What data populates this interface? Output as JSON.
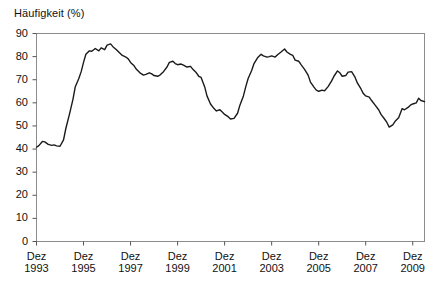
{
  "chart_data": {
    "type": "line",
    "title": "Häufigkeit (%)",
    "xlabel": "",
    "ylabel": "Häufigkeit (%)",
    "ylim": [
      0,
      90
    ],
    "ytick_values": [
      0,
      10,
      20,
      30,
      40,
      50,
      60,
      70,
      80,
      90
    ],
    "ytick_labels": [
      "0",
      "10",
      "20",
      "30",
      "40",
      "50",
      "60",
      "70",
      "80",
      "90"
    ],
    "xtick_labels": [
      {
        "line1": "Dez",
        "line2": "1993"
      },
      {
        "line1": "Dez",
        "line2": "1995"
      },
      {
        "line1": "Dez",
        "line2": "1997"
      },
      {
        "line1": "Dez",
        "line2": "1999"
      },
      {
        "line1": "Dez",
        "line2": "2001"
      },
      {
        "line1": "Dez",
        "line2": "2003"
      },
      {
        "line1": "Dez",
        "line2": "2005"
      },
      {
        "line1": "Dez",
        "line2": "2007"
      },
      {
        "line1": "Dez",
        "line2": "2009"
      }
    ],
    "xtick_x_values": [
      1993.95,
      1995.95,
      1997.95,
      1999.95,
      2001.95,
      2003.95,
      2005.95,
      2007.95,
      2009.95
    ],
    "xlim": [
      1993.95,
      2010.45
    ],
    "grid": false,
    "legend": null,
    "series": [
      {
        "name": "Häufigkeit",
        "color": "#1a1a1a",
        "x": [
          1993.95,
          1994.05,
          1994.2,
          1994.3,
          1994.45,
          1994.6,
          1994.7,
          1994.8,
          1994.95,
          1995.1,
          1995.2,
          1995.35,
          1995.5,
          1995.6,
          1995.75,
          1995.85,
          1995.95,
          1996.05,
          1996.2,
          1996.3,
          1996.45,
          1996.6,
          1996.7,
          1996.85,
          1996.95,
          1997.1,
          1997.2,
          1997.35,
          1997.5,
          1997.6,
          1997.75,
          1997.85,
          1997.95,
          1998.1,
          1998.2,
          1998.35,
          1998.5,
          1998.6,
          1998.75,
          1998.85,
          1998.95,
          1999.1,
          1999.2,
          1999.35,
          1999.5,
          1999.6,
          1999.75,
          1999.85,
          1999.95,
          2000.1,
          2000.2,
          2000.35,
          2000.5,
          2000.6,
          2000.75,
          2000.85,
          2000.95,
          2001.1,
          2001.2,
          2001.35,
          2001.5,
          2001.6,
          2001.75,
          2001.85,
          2001.95,
          2002.1,
          2002.2,
          2002.35,
          2002.5,
          2002.6,
          2002.75,
          2002.85,
          2002.95,
          2003.1,
          2003.2,
          2003.35,
          2003.5,
          2003.6,
          2003.75,
          2003.85,
          2003.95,
          2004.1,
          2004.2,
          2004.35,
          2004.5,
          2004.6,
          2004.75,
          2004.85,
          2004.95,
          2005.1,
          2005.2,
          2005.35,
          2005.5,
          2005.6,
          2005.75,
          2005.85,
          2005.95,
          2006.1,
          2006.2,
          2006.35,
          2006.5,
          2006.6,
          2006.75,
          2006.85,
          2006.95,
          2007.1,
          2007.2,
          2007.35,
          2007.5,
          2007.6,
          2007.75,
          2007.85,
          2007.95,
          2008.1,
          2008.2,
          2008.35,
          2008.5,
          2008.6,
          2008.75,
          2008.85,
          2008.95,
          2009.1,
          2009.2,
          2009.35,
          2009.5,
          2009.6,
          2009.75,
          2009.85,
          2009.95,
          2010.1,
          2010.2,
          2010.3,
          2010.45
        ],
        "y": [
          40.8,
          41.5,
          43.3,
          43.1,
          42.0,
          41.6,
          41.8,
          41.4,
          41.2,
          44.0,
          49.0,
          55.0,
          61.5,
          67.0,
          70.5,
          73.5,
          77.5,
          81.0,
          82.5,
          82.3,
          83.5,
          82.5,
          83.8,
          83.0,
          85.0,
          85.5,
          84.3,
          83.0,
          81.5,
          80.5,
          79.8,
          79.0,
          77.5,
          76.0,
          74.5,
          73.0,
          72.0,
          72.3,
          73.0,
          72.5,
          71.8,
          71.5,
          72.0,
          73.5,
          75.5,
          77.5,
          78.0,
          77.0,
          76.5,
          76.8,
          76.3,
          75.5,
          75.8,
          74.5,
          73.0,
          71.5,
          71.0,
          67.0,
          63.0,
          59.5,
          57.5,
          56.5,
          57.0,
          56.0,
          55.0,
          54.0,
          53.0,
          53.3,
          55.5,
          59.0,
          63.0,
          67.0,
          70.5,
          74.0,
          77.0,
          79.5,
          81.0,
          80.3,
          79.8,
          80.0,
          80.3,
          79.8,
          80.8,
          82.0,
          83.3,
          82.0,
          81.0,
          80.5,
          78.5,
          78.0,
          76.5,
          74.5,
          72.0,
          69.0,
          66.8,
          65.5,
          65.0,
          65.5,
          65.2,
          67.0,
          69.5,
          71.5,
          73.8,
          73.0,
          71.5,
          71.8,
          73.3,
          73.5,
          71.0,
          68.5,
          66.0,
          64.0,
          63.0,
          62.5,
          61.0,
          59.0,
          57.0,
          55.0,
          53.0,
          51.5,
          49.5,
          50.5,
          52.0,
          53.5,
          57.5,
          57.0,
          58.0,
          59.0,
          59.5,
          60.0,
          62.0,
          61.0,
          60.5
        ]
      }
    ],
    "series_extra": {
      "note": "continuation",
      "x": [
        2010.45,
        2010.6,
        2010.75,
        2010.85
      ],
      "y": [
        60.5,
        61.0,
        62.0,
        61.5
      ]
    }
  },
  "axes": {
    "frame_color": "#888888",
    "tick_color": "#555555",
    "line_color": "#1a1a1a"
  }
}
